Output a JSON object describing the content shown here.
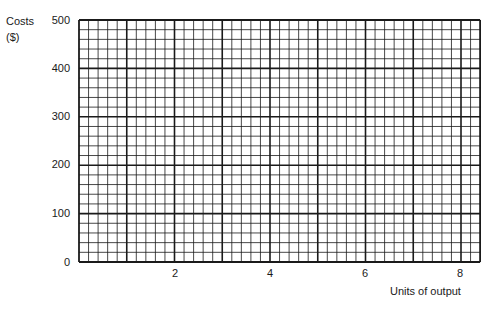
{
  "chart_data": {
    "type": "line",
    "title": "",
    "xlabel": "Units of output",
    "ylabel_line1": "Costs",
    "ylabel_line2": "($)",
    "xlim": [
      0,
      8.4
    ],
    "ylim": [
      0,
      500
    ],
    "x_ticks": [
      "2",
      "4",
      "6",
      "8"
    ],
    "y_ticks": [
      "0",
      "100",
      "200",
      "300",
      "400",
      "500"
    ],
    "grid": true,
    "grid_major_x_step": 1,
    "grid_minor_x_per_major": 5,
    "grid_major_y_step": 100,
    "grid_minor_y_per_major": 5,
    "series": []
  },
  "colors": {
    "grid": "#1a1a1a",
    "background": "#ffffff"
  }
}
